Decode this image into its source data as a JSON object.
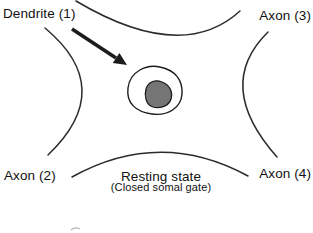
{
  "diagram": {
    "figure_type": "neuron-soma-schematic",
    "labels": {
      "dendrite1": "Dendrite (1)",
      "axon3": "Axon (3)",
      "axon2": "Axon (2)",
      "axon4": "Axon (4)"
    },
    "caption": {
      "title": "Resting state",
      "subtitle": "(Closed somal gate)"
    },
    "colors": {
      "background": "#ffffff",
      "line": "#2b2b2b",
      "text": "#111111",
      "soma_fill": "#ffffff",
      "nucleus_fill": "#757575",
      "nucleus_stroke": "#1c1c1c"
    }
  }
}
